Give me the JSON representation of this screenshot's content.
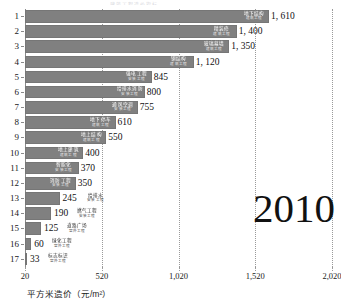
{
  "page": {
    "cut_title": "建筑工程造价指标",
    "year_badge": "2010"
  },
  "chart_data": {
    "type": "bar",
    "orientation": "horizontal",
    "title": "",
    "xlabel": "平方米造价（元/m²）",
    "ylabel": "",
    "xlim": [
      20,
      2020
    ],
    "xticks": [
      20,
      520,
      1020,
      1520,
      2020
    ],
    "xtick_labels": [
      "20",
      "520",
      "1,020",
      "1,520",
      "2,020"
    ],
    "grid": true,
    "legend": "none",
    "bar_color": "#808080",
    "categories": [
      "地下结构",
      "精装修",
      "玻璃幕墙",
      "钢结构",
      "强电工程",
      "给排水消防",
      "通风空调",
      "地下停车",
      "地上结构",
      "地上建筑",
      "智能化",
      "消防工程",
      "给排水",
      "燃气工程",
      "道路广场",
      "绿化工程",
      "标志标识"
    ],
    "sub_categories": [
      "建筑工程",
      "建筑工程",
      "建筑工程",
      "建筑工程",
      "安装工程",
      "安装工程",
      "安装工程",
      "建筑工程",
      "建筑工程",
      "建筑工程",
      "安装工程",
      "安装工程",
      "安装工程",
      "安装工程",
      "室外工程",
      "室外工程",
      "室外工程"
    ],
    "ytick_labels": [
      "1",
      "2",
      "3",
      "4",
      "5",
      "6",
      "7",
      "8",
      "9",
      "10",
      "11",
      "12",
      "13",
      "14",
      "15",
      "16",
      "17"
    ],
    "values": [
      1610,
      1400,
      1350,
      1120,
      845,
      800,
      755,
      610,
      550,
      400,
      370,
      350,
      245,
      190,
      125,
      60,
      33
    ],
    "value_labels": [
      "1, 610",
      "1, 400",
      "1, 350",
      "1, 120",
      "845",
      "800",
      "755",
      "610",
      "550",
      "400",
      "370",
      "350",
      "245",
      "190",
      "125",
      "60",
      "33"
    ]
  }
}
